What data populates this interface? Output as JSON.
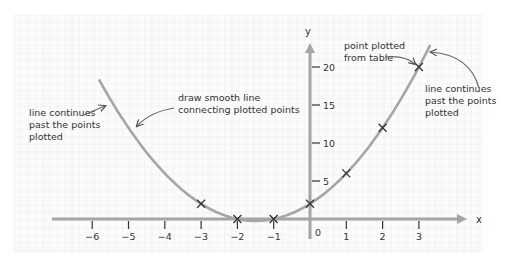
{
  "chart_data": {
    "type": "line",
    "title": "",
    "xlabel": "x",
    "ylabel": "y",
    "xlim": [
      -6.5,
      3.8
    ],
    "ylim": [
      -1.5,
      23
    ],
    "x_ticks": [
      -6,
      -5,
      -4,
      -3,
      -2,
      -1,
      1,
      2,
      3
    ],
    "x_tick_labels": [
      "−6",
      "−5",
      "−4",
      "−3",
      "−2",
      "−1",
      "1",
      "2",
      "3"
    ],
    "origin_label": "0",
    "y_ticks": [
      5,
      10,
      15,
      20
    ],
    "y_tick_labels": [
      "5",
      "10",
      "15",
      "20"
    ],
    "grid": true,
    "series": [
      {
        "name": "plotted points",
        "marker": "x",
        "x": [
          -3,
          -2,
          -1,
          0,
          1,
          2,
          3
        ],
        "y": [
          2,
          0,
          0,
          2,
          6,
          12,
          20
        ]
      },
      {
        "name": "smooth curve y = x² + 3x + 2",
        "x_range": [
          -5.8,
          3.3
        ],
        "coefficients": [
          1,
          3,
          2
        ]
      }
    ],
    "annotations": [
      {
        "id": "left",
        "lines": [
          "line continues",
          "past the points",
          "plotted"
        ]
      },
      {
        "id": "middle",
        "lines": [
          "draw smooth line",
          "connecting plotted points"
        ]
      },
      {
        "id": "top",
        "lines": [
          "point plotted",
          "from table"
        ]
      },
      {
        "id": "right",
        "lines": [
          "line continues",
          "past the points",
          "plotted"
        ]
      }
    ]
  },
  "colors": {
    "curve": "#a5a5a5",
    "axis": "#a5a5a5",
    "grid": "#eeeeee",
    "marker": "#333333",
    "text": "#333333",
    "arrow": "#666666"
  }
}
